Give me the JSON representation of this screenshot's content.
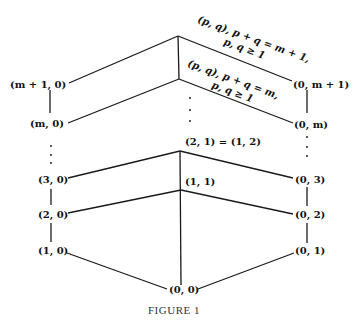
{
  "figure": {
    "caption": "FIGURE 1",
    "nodes": [
      {
        "id": "m1_0",
        "label": "(m + 1, 0)",
        "x": 10,
        "y": 84
      },
      {
        "id": "m_0",
        "label": "(m, 0)",
        "x": 32,
        "y": 125
      },
      {
        "id": "3_0",
        "label": "(3, 0)",
        "x": 40,
        "y": 181
      },
      {
        "id": "2_0",
        "label": "(2, 0)",
        "x": 40,
        "y": 215
      },
      {
        "id": "1_0",
        "label": "(1, 0)",
        "x": 40,
        "y": 251
      },
      {
        "id": "0_m1",
        "label": "(0, m + 1)",
        "x": 294,
        "y": 84
      },
      {
        "id": "0_m",
        "label": "(0, m)",
        "x": 294,
        "y": 125
      },
      {
        "id": "0_3",
        "label": "(0, 3)",
        "x": 296,
        "y": 181
      },
      {
        "id": "0_2",
        "label": "(0, 2)",
        "x": 296,
        "y": 217
      },
      {
        "id": "0_1",
        "label": "(0, 1)",
        "x": 296,
        "y": 253
      },
      {
        "id": "2_1",
        "label": "(2, 1) = (1, 2)",
        "x": 185,
        "y": 146
      },
      {
        "id": "1_1",
        "label": "(1, 1)",
        "x": 185,
        "y": 186
      },
      {
        "id": "0_0",
        "label": "(0, 0)",
        "x": 169,
        "y": 292
      }
    ],
    "annotations": [
      {
        "id": "top_layer",
        "lines": [
          "(p, q), p + q = m + 1,",
          "p, q ≥ 1"
        ]
      },
      {
        "id": "second_layer",
        "lines": [
          "(p, q), p + q = m,",
          "p, q ≥ 1"
        ]
      }
    ]
  }
}
